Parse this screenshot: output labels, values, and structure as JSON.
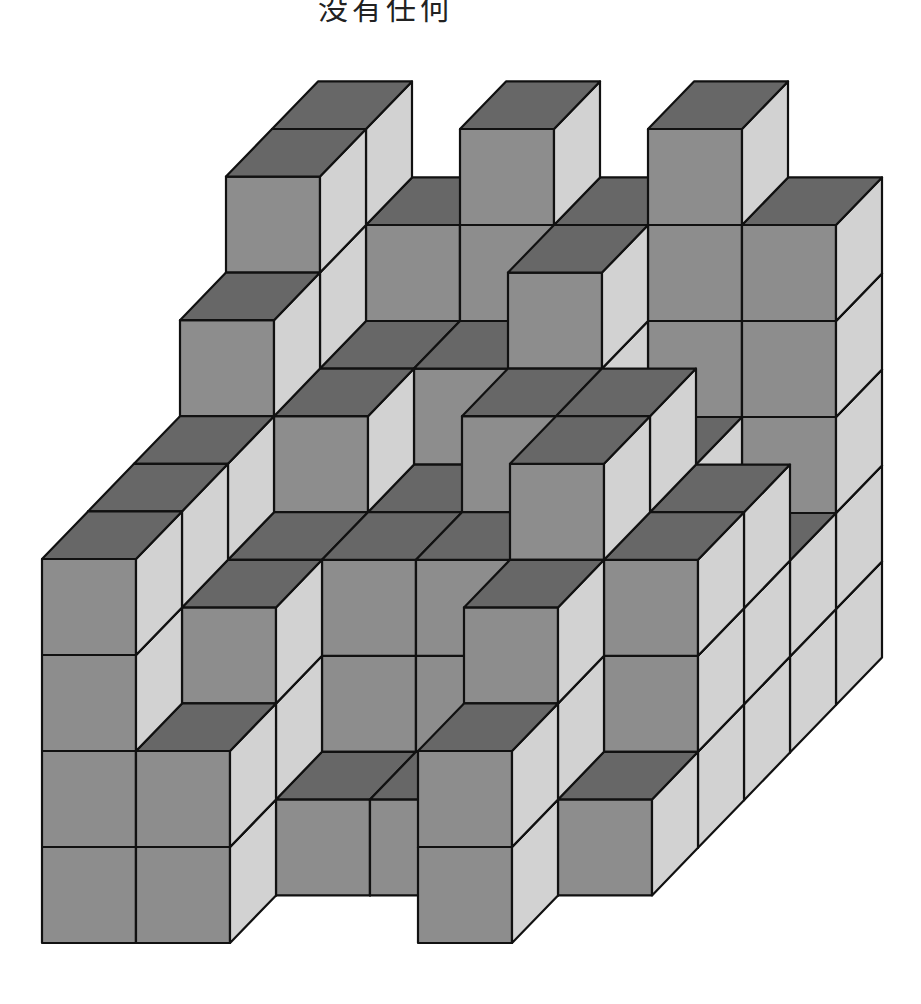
{
  "caption": {
    "text": "没有任何"
  },
  "figure": {
    "colors": {
      "top": "#676767",
      "front": "#8d8d8d",
      "side": "#d2d2d2",
      "edge": "#111111"
    },
    "projection": {
      "origin_x": 42,
      "origin_y": 943,
      "cube_width": 94,
      "cube_height": 96,
      "depth_dx": 46,
      "depth_dy": 47.6
    },
    "grid": {
      "columns": 6,
      "depths": 6
    },
    "heights_by_depth": [
      [
        4,
        2,
        0,
        0,
        2,
        0
      ],
      [
        4,
        3,
        1,
        1,
        3,
        1
      ],
      [
        4,
        3,
        3,
        3,
        4,
        3
      ],
      [
        5,
        4,
        3,
        4,
        4,
        3
      ],
      [
        6,
        4,
        4,
        5,
        3,
        2
      ],
      [
        6,
        5,
        6,
        5,
        6,
        5
      ]
    ]
  }
}
